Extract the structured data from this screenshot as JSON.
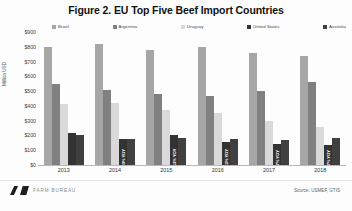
{
  "chart_data": {
    "type": "bar",
    "title": "Figure 2. EU Top Five Beef Import Countries",
    "xlabel": "",
    "ylabel": "Million USD",
    "ylim": [
      0,
      900
    ],
    "ytick_labels": [
      "$900",
      "$800",
      "$700",
      "$600",
      "$500",
      "$400",
      "$300",
      "$200",
      "$100",
      "$0"
    ],
    "ytick_values": [
      900,
      800,
      700,
      600,
      500,
      400,
      300,
      200,
      100,
      0
    ],
    "grid": false,
    "legend_position": "top",
    "categories": [
      "2013",
      "2014",
      "2015",
      "2016",
      "2017",
      "2018"
    ],
    "series": [
      {
        "name": "Brazil",
        "color": "#a6a6a6",
        "values": [
          800,
          820,
          775,
          800,
          760,
          740
        ]
      },
      {
        "name": "Argentina",
        "color": "#808080",
        "values": [
          545,
          505,
          480,
          470,
          500,
          560
        ]
      },
      {
        "name": "Uruguay",
        "color": "#d9d9d9",
        "values": [
          415,
          420,
          370,
          350,
          300,
          255
        ]
      },
      {
        "name": "United States",
        "color": "#333333",
        "values": [
          220,
          175,
          200,
          155,
          145,
          135
        ]
      },
      {
        "name": "Australia",
        "color": "#404040",
        "values": [
          205,
          175,
          180,
          175,
          170,
          185
        ]
      }
    ],
    "annotations": [
      {
        "year": "2013",
        "series": "United States",
        "text": ""
      },
      {
        "year": "2014",
        "series": "United States",
        "text": "-20% YOY"
      },
      {
        "year": "2015",
        "series": "United States",
        "text": "+13% YOY"
      },
      {
        "year": "2016",
        "series": "United States",
        "text": "-23% YOY"
      },
      {
        "year": "2017",
        "series": "United States",
        "text": "-7% YOY"
      },
      {
        "year": "2018",
        "series": "United States",
        "text": "-7% YOY"
      }
    ],
    "source": "Source: USMEF, GTIS"
  },
  "footer": {
    "logo_text": "FARM BUREAU",
    "source": "Source: USMEF, GTIS"
  }
}
